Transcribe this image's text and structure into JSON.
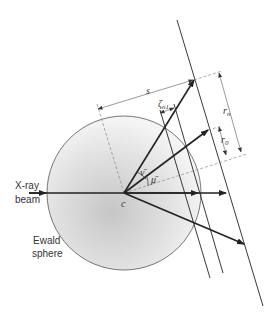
{
  "diagram": {
    "labels": {
      "beam_line1": "X-ray",
      "beam_line2": "beam",
      "sphere_line1": "Ewald",
      "sphere_line2": "sphere",
      "center": "c",
      "s": "s",
      "zeta": "ζ",
      "zeta_sub": "n1",
      "r_n": "r",
      "r_n_sub": "n",
      "r_0": "r",
      "r_0_sub": "0",
      "nu": "ν̄",
      "mu": "μ̄"
    },
    "colors": {
      "line": "#222222",
      "dashed": "#888888",
      "sphere_light": "#f2f2f2",
      "sphere_dark": "#c8c8c8"
    }
  }
}
